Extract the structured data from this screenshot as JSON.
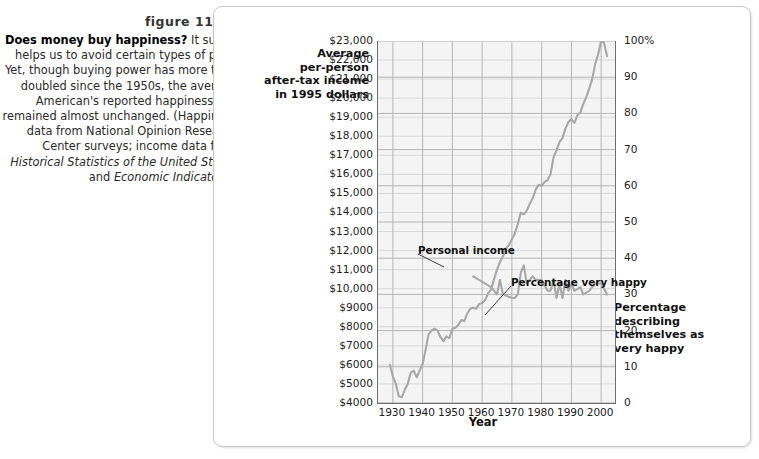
{
  "caption": {
    "figure_number": "figure 11.15",
    "lead": "Does money buy happiness?",
    "body_1": " It surely helps us to avoid certain types of pain. Yet, though buying power has more than doubled since the 1950s, the average American's reported happiness has remained almost unchanged. (Happiness data from National Opinion Research Center surveys; income data from ",
    "source_1": "Historical Statistics of the United States",
    "body_2": " and ",
    "source_2": "Economic Indicators",
    "body_3": ".)"
  },
  "chart_data": {
    "type": "line",
    "title": "",
    "xlabel": "Year",
    "ylabel_left": "Average\nper-person\nafter-tax income\nin 1995 dollars",
    "ylabel_left_lines": [
      "Average",
      "per-person",
      "after-tax income",
      "in 1995 dollars"
    ],
    "ylabel_right_lines": [
      "Percentage",
      "describing",
      "themselves as",
      "very happy"
    ],
    "grid": true,
    "legend_position": "inline-annotation",
    "xlim": [
      1925,
      2005
    ],
    "x_ticks": [
      1930,
      1940,
      1950,
      1960,
      1970,
      1980,
      1990,
      2000
    ],
    "x_tick_labels": [
      "1930",
      "1940",
      "1950",
      "1960",
      "1970",
      "1980",
      "1990",
      "2000"
    ],
    "ylim_left": [
      4000,
      23000
    ],
    "y_ticks_left": [
      4000,
      5000,
      6000,
      7000,
      8000,
      9000,
      10000,
      11000,
      12000,
      13000,
      14000,
      15000,
      16000,
      17000,
      18000,
      19000,
      20000,
      21000,
      22000,
      23000
    ],
    "y_tick_labels_left": [
      "$4000",
      "$5000",
      "$6000",
      "$7000",
      "$8000",
      "$9000",
      "$10,000",
      "$11,000",
      "$12,000",
      "$13,000",
      "$14,000",
      "$15,000",
      "$16,000",
      "$17,000",
      "$18,000",
      "$19,000",
      "$20,000",
      "$21,000",
      "$22,000",
      "$23,000"
    ],
    "ylim_right": [
      0,
      100
    ],
    "y_ticks_right": [
      0,
      10,
      20,
      30,
      40,
      50,
      60,
      70,
      80,
      90,
      100
    ],
    "y_tick_labels_right": [
      "0",
      "10",
      "20",
      "30",
      "40",
      "50",
      "60",
      "70",
      "80",
      "90",
      "100%"
    ],
    "annotations": [
      {
        "text": "Personal income",
        "x": 1952,
        "y": 13700
      },
      {
        "text": "Percentage very happy",
        "x": 1972,
        "y": 10600
      }
    ],
    "line_color": "#a8a8a8",
    "series": [
      {
        "name": "Personal income",
        "axis": "left",
        "units": "1995 dollars",
        "x": [
          1929,
          1930,
          1931,
          1932,
          1933,
          1934,
          1935,
          1936,
          1937,
          1938,
          1939,
          1940,
          1941,
          1942,
          1943,
          1944,
          1945,
          1946,
          1947,
          1948,
          1949,
          1950,
          1951,
          1952,
          1953,
          1954,
          1955,
          1956,
          1957,
          1958,
          1959,
          1960,
          1961,
          1962,
          1963,
          1964,
          1965,
          1966,
          1967,
          1968,
          1969,
          1970,
          1971,
          1972,
          1973,
          1974,
          1975,
          1976,
          1977,
          1978,
          1979,
          1980,
          1981,
          1982,
          1983,
          1984,
          1985,
          1986,
          1987,
          1988,
          1989,
          1990,
          1991,
          1992,
          1993,
          1994,
          1995,
          1996,
          1997,
          1998,
          1999,
          2000,
          2001,
          2002
        ],
        "values": [
          6000,
          5400,
          5000,
          4350,
          4300,
          4700,
          5000,
          5600,
          5700,
          5350,
          5700,
          6050,
          6800,
          7600,
          7800,
          7900,
          7800,
          7450,
          7250,
          7500,
          7400,
          7900,
          7950,
          8100,
          8350,
          8300,
          8700,
          8950,
          9000,
          8950,
          9200,
          9250,
          9400,
          9750,
          9950,
          10500,
          11000,
          11400,
          11700,
          12100,
          12300,
          12600,
          12900,
          13400,
          14000,
          13900,
          14100,
          14450,
          14750,
          15200,
          15450,
          15400,
          15600,
          15700,
          16000,
          16900,
          17250,
          17700,
          17900,
          18400,
          18750,
          18900,
          18700,
          19100,
          19250,
          19700,
          20050,
          20500,
          21000,
          21800,
          22300,
          23000,
          22900,
          22200
        ]
      },
      {
        "name": "Percentage very happy",
        "axis": "right",
        "units": "percent",
        "x": [
          1957,
          1963,
          1965,
          1966,
          1967,
          1970,
          1971,
          1972,
          1973,
          1974,
          1975,
          1976,
          1977,
          1978,
          1980,
          1982,
          1983,
          1984,
          1985,
          1986,
          1987,
          1988,
          1989,
          1990,
          1991,
          1993,
          1994,
          1996,
          1998,
          2000,
          2002
        ],
        "values": [
          35,
          32,
          30,
          34,
          30,
          29,
          29,
          30,
          36,
          38,
          33,
          34,
          35,
          34,
          34,
          31,
          31,
          34,
          29,
          33,
          29,
          34,
          31,
          33,
          31,
          32,
          30,
          31,
          33,
          33,
          30
        ]
      }
    ]
  }
}
